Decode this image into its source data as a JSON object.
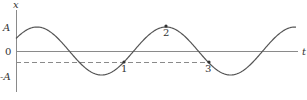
{
  "figure": {
    "y_axis_label": "x",
    "x_axis_label": "t",
    "tick_labels": {
      "positive_amplitude": "A",
      "zero": "0",
      "negative_amplitude": "-A"
    },
    "points": [
      {
        "label": "1",
        "px": 124,
        "py": 62
      },
      {
        "label": "2",
        "px": 166,
        "py": 26
      },
      {
        "label": "3",
        "px": 209,
        "py": 62
      }
    ],
    "colors": {
      "curve": "#555555",
      "axis": "#888888",
      "dashed": "#888888",
      "text": "#333333"
    }
  },
  "chart_data": {
    "type": "line",
    "title": "",
    "xlabel": "t",
    "ylabel": "x",
    "y_ticks": [
      "A",
      "0",
      "-A"
    ],
    "amplitude": "A",
    "dashed_level": -0.46,
    "points": [
      {
        "label": "1",
        "x_value": "-0.46A",
        "phase": "moving upward"
      },
      {
        "label": "2",
        "x_value": "A",
        "phase": "maximum"
      },
      {
        "label": "3",
        "x_value": "-0.46A",
        "phase": "moving downward"
      }
    ],
    "grid": false,
    "legend": null
  }
}
